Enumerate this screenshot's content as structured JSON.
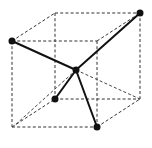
{
  "diagram": {
    "title": "",
    "colors": {
      "background": "#ffffff",
      "bond": "#111111",
      "atom": "#111111",
      "edge": "#333333"
    },
    "cube": {
      "front_face": {
        "left": 12,
        "right": 97,
        "top": 41,
        "bottom": 127
      },
      "back_face": {
        "left": 55,
        "right": 140,
        "top": 13,
        "bottom": 99
      },
      "style": "dashed"
    },
    "center_atom": {
      "x": 76,
      "y": 70,
      "r": 3.5
    },
    "corner_atoms": [
      {
        "name": "front-top-left",
        "x": 12,
        "y": 41,
        "r": 3.5
      },
      {
        "name": "back-top-right",
        "x": 140,
        "y": 13,
        "r": 3.5
      },
      {
        "name": "back-bottom-left",
        "x": 55,
        "y": 99,
        "r": 3.5
      },
      {
        "name": "front-bottom-right",
        "x": 97,
        "y": 127,
        "r": 3.5
      }
    ],
    "bonds": [
      {
        "from": "center",
        "to": "front-top-left",
        "style": "solid"
      },
      {
        "from": "center",
        "to": "back-top-right",
        "style": "solid"
      },
      {
        "from": "center",
        "to": "back-bottom-left",
        "style": "solid"
      },
      {
        "from": "center",
        "to": "front-bottom-right",
        "style": "solid"
      }
    ],
    "guide_lines": [
      {
        "from": "center",
        "to": "front-bottom-left-corner",
        "style": "dashed"
      },
      {
        "from": "center",
        "to": "back-bottom-right-corner",
        "style": "dashed"
      }
    ]
  }
}
